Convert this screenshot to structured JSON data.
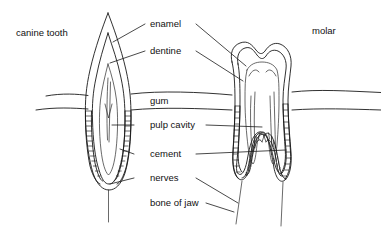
{
  "figure": {
    "background_color": "#ffffff",
    "line_color": "#1a1a1a",
    "text_color": "#111111"
  },
  "corner_labels": {
    "left": "canine tooth",
    "right": "molar"
  },
  "labels": [
    {
      "id": "enamel",
      "text": "enamel",
      "x": 150,
      "y": 24
    },
    {
      "id": "dentine",
      "text": "dentine",
      "x": 150,
      "y": 51
    },
    {
      "id": "gum",
      "text": "gum",
      "x": 150,
      "y": 101
    },
    {
      "id": "pulp-cavity",
      "text": "pulp cavity",
      "x": 150,
      "y": 125
    },
    {
      "id": "cement",
      "text": "cement",
      "x": 150,
      "y": 154
    },
    {
      "id": "nerves",
      "text": "nerves",
      "x": 150,
      "y": 178
    },
    {
      "id": "bone-of-jaw",
      "text": "bone of jaw",
      "x": 150,
      "y": 203
    }
  ],
  "structures": {
    "canine": {
      "name": "canine tooth",
      "parts": [
        "enamel",
        "dentine",
        "pulp cavity",
        "cement",
        "nerve"
      ]
    },
    "molar": {
      "name": "molar",
      "parts": [
        "enamel",
        "dentine",
        "pulp cavity",
        "cement",
        "nerves"
      ],
      "root_count": 2
    },
    "gum": {
      "name": "gum line"
    }
  }
}
